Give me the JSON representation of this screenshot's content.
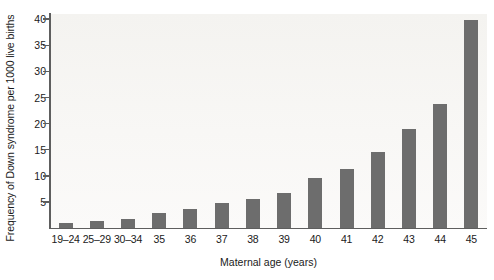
{
  "chart_data": {
    "type": "bar",
    "title": "",
    "xlabel": "Maternal age (years)",
    "ylabel": "Frequency of Down syndrome per 1000 live births",
    "categories": [
      "19–24",
      "25–29",
      "30–34",
      "35",
      "36",
      "37",
      "38",
      "39",
      "40",
      "41",
      "42",
      "43",
      "44",
      "45"
    ],
    "values": [
      0.9,
      1.4,
      1.8,
      2.8,
      3.6,
      4.7,
      5.6,
      6.8,
      9.6,
      11.4,
      14.5,
      19.0,
      23.8,
      39.8
    ],
    "ylim": [
      0,
      41
    ],
    "yticks": [
      5,
      10,
      15,
      20,
      25,
      30,
      35,
      40
    ],
    "ytick_labels": [
      "5",
      "10",
      "15",
      "20",
      "25",
      "30",
      "35",
      "40"
    ],
    "grid": false,
    "legend": null,
    "bar_color": "#6d6d6d",
    "plot_background": "#f7f6f3",
    "axis_color": "#5e5e5e"
  }
}
